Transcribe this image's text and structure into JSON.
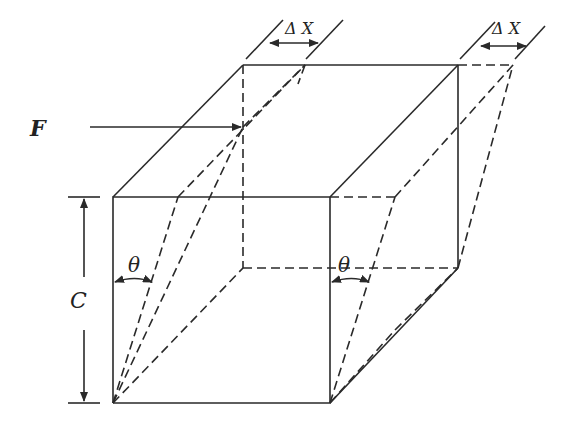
{
  "diagram": {
    "labels": {
      "force": "F",
      "height": "C",
      "angle_left": "θ",
      "angle_right": "θ",
      "displacement_left": "Δ X",
      "displacement_right": "Δ X"
    },
    "colors": {
      "stroke": "#2a2a2a",
      "background": "#ffffff"
    }
  }
}
